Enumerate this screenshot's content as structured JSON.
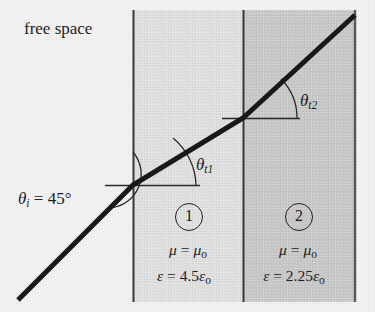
{
  "figure": {
    "kind": "ray-refraction-diagram",
    "exterior_label": "free space",
    "background_color": "#fbfbfb",
    "ray_color": "#1a1a1a",
    "boundaries_x": [
      133,
      243,
      355
    ],
    "slab_top_y": 10,
    "slab_bottom_y": 302
  },
  "angles": {
    "incident": {
      "symbol": "θ",
      "subscript": "i",
      "equals": " = 45",
      "degree": "°"
    },
    "transmitted_1": {
      "symbol": "θ",
      "subscript": "t1"
    },
    "transmitted_2": {
      "symbol": "θ",
      "subscript": "t2"
    }
  },
  "regions": [
    {
      "number": "1",
      "fill_color": "#e8e8e8",
      "mu_symbol": "μ",
      "mu_value": "μ",
      "mu_sub": "o",
      "eps_symbol": "ε",
      "eps_coefficient": "4.5",
      "eps_unit": "ε",
      "eps_sub": "o"
    },
    {
      "number": "2",
      "fill_color": "#d2d2d2",
      "mu_symbol": "μ",
      "mu_value": "μ",
      "mu_sub": "o",
      "eps_symbol": "ε",
      "eps_coefficient": "2.25",
      "eps_unit": "ε",
      "eps_sub": "o"
    }
  ],
  "ray_path": {
    "points": [
      [
        18,
        300
      ],
      [
        133,
        185
      ],
      [
        243,
        118
      ],
      [
        355,
        15
      ]
    ],
    "stroke_width": 5
  },
  "reference_lines": [
    {
      "name": "theta-t1-horizontal",
      "x1": 105,
      "y1": 185,
      "x2": 200,
      "y2": 185
    },
    {
      "name": "theta-t2-horizontal",
      "x1": 222,
      "y1": 118,
      "x2": 300,
      "y2": 118
    }
  ]
}
